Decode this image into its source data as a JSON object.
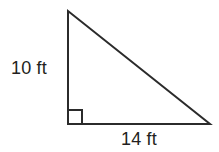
{
  "figure": {
    "kind": "right-triangle-diagram",
    "canvas": {
      "width": 219,
      "height": 152,
      "background": "#ffffff"
    },
    "stroke": {
      "color": "#2b2b2b",
      "width": 2
    },
    "text_color": "#231f20",
    "vertices": {
      "apex": {
        "x": 68,
        "y": 11
      },
      "right_angle": {
        "x": 68,
        "y": 124
      },
      "base_right": {
        "x": 210,
        "y": 124
      }
    },
    "right_angle_marker": {
      "name": "right-angle-square",
      "x": 68,
      "y": 110,
      "size": 14,
      "present": true
    },
    "labels": {
      "vertical_leg": "10 ft",
      "horizontal_leg": "14 ft"
    },
    "measurements": {
      "vertical_leg_value": 10,
      "vertical_leg_unit": "ft",
      "horizontal_leg_value": 14,
      "horizontal_leg_unit": "ft"
    }
  }
}
